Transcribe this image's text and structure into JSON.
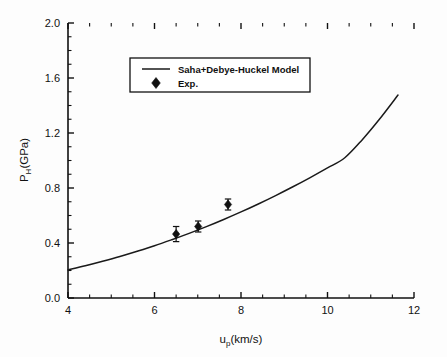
{
  "chart_data": {
    "type": "line",
    "title": "",
    "subtitle": "",
    "xlabel": "u_p(km/s)",
    "xlabel_base": "u",
    "xlabel_sub": "p",
    "xlabel_rest": "(km/s)",
    "ylabel": "P_H(GPa)",
    "ylabel_base": "P",
    "ylabel_sub": "H",
    "ylabel_rest": "(GPa)",
    "xlim": [
      4,
      12
    ],
    "ylim": [
      0.0,
      2.0
    ],
    "xticks": [
      4,
      6,
      8,
      10,
      12
    ],
    "xtick_labels": [
      "4",
      "6",
      "8",
      "10",
      "12"
    ],
    "yticks": [
      0.0,
      0.4,
      0.8,
      1.2,
      1.6,
      2.0
    ],
    "ytick_labels": [
      "0.0",
      "0.4",
      "0.8",
      "1.2",
      "1.6",
      "2.0"
    ],
    "x_minor_interval": 0.5,
    "y_minor_interval": 0.1,
    "grid": false,
    "legend_position": "upper-left-inset",
    "series": [
      {
        "name": "Saha+Debye-Huckel Model",
        "type": "line",
        "x": [
          4.0,
          4.4,
          4.8,
          5.2,
          5.6,
          6.0,
          6.4,
          6.8,
          7.2,
          7.6,
          8.0,
          8.4,
          8.8,
          9.2,
          9.6,
          10.0,
          10.4,
          10.8,
          11.2,
          11.63
        ],
        "y": [
          0.204,
          0.234,
          0.267,
          0.302,
          0.34,
          0.38,
          0.424,
          0.47,
          0.519,
          0.571,
          0.626,
          0.684,
          0.745,
          0.809,
          0.876,
          0.946,
          1.02,
          1.15,
          1.3,
          1.476
        ]
      },
      {
        "name": "Exp.",
        "type": "scatter",
        "marker": "diamond",
        "x": [
          6.5,
          7.01,
          7.7
        ],
        "y": [
          0.465,
          0.52,
          0.68
        ],
        "yerr": [
          0.055,
          0.04,
          0.04
        ]
      }
    ],
    "legend_entries": [
      {
        "label": "Saha+Debye-Huckel Model",
        "marker": "line"
      },
      {
        "label": "Exp.",
        "marker": "diamond"
      }
    ]
  },
  "figure": {
    "background_color": "#fdfdfd",
    "axis_color": "#111111",
    "curve_color": "#1a1a1a",
    "marker_color": "#111111"
  }
}
